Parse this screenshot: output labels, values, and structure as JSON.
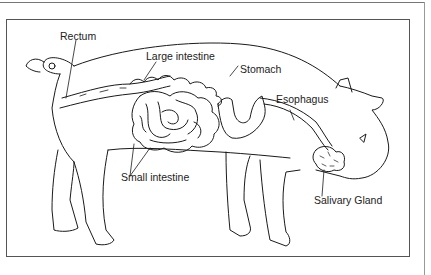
{
  "diagram": {
    "labels": {
      "rectum": "Rectum",
      "large_intestine": "Large intestine",
      "stomach": "Stomach",
      "esophagus": "Esophagus",
      "small_intestine": "Small intestine",
      "salivary_gland": "Salivary Gland"
    }
  },
  "colors": {
    "line": "#1a1a1a",
    "frame": "#555555",
    "background": "#ffffff"
  }
}
